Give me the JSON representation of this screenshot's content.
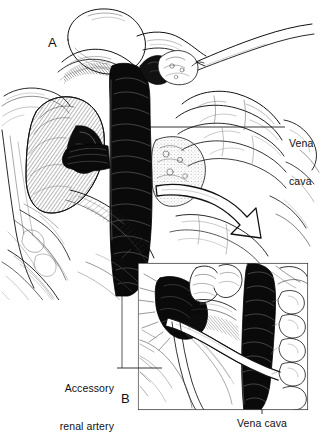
{
  "figure": {
    "type": "medical-surgical-illustration",
    "style": "pen-and-ink line drawing",
    "background_color": "#ffffff",
    "ink_color": "#111111",
    "width": 323,
    "height": 434
  },
  "panels": [
    {
      "id": "A",
      "letter": "A",
      "position": {
        "x": 48,
        "y": 36
      },
      "description": "Main operative field view: right kidney retracted, inferior vena cava exposed vertically in center, bowel loops reflected to the right, duodenum superiorly, curved retraction arrow indicating medial mobilization"
    },
    {
      "id": "B",
      "letter": "B",
      "position": {
        "x": 121,
        "y": 392
      },
      "description": "Magnified inset detail: accessory renal artery crossing anterior to the vena cava",
      "inset_box": {
        "x": 138,
        "y": 263,
        "width": 170,
        "height": 147
      }
    }
  ],
  "annotations": [
    {
      "id": "vena-cava-top",
      "text_lines": [
        "Vena",
        "cava"
      ],
      "align": "left",
      "text_position": {
        "x": 289,
        "y": 113
      },
      "leader": {
        "type": "horizontal",
        "x1": 150,
        "y1": 127,
        "x2": 285,
        "y2": 127
      }
    },
    {
      "id": "accessory-renal-artery",
      "text_lines": [
        "Accessory",
        "renal artery"
      ],
      "align": "right",
      "text_position": {
        "x": 44,
        "y": 358
      },
      "leader": {
        "type": "horizontal",
        "x1": 118,
        "y1": 368,
        "x2": 160,
        "y2": 368
      }
    },
    {
      "id": "vena-cava-bottom",
      "text_lines": [
        "Vena cava"
      ],
      "align": "center",
      "text_position": {
        "x": 228,
        "y": 418
      },
      "leader": {
        "type": "vertical",
        "x1": 262,
        "y1": 410,
        "x2": 262,
        "y2": 413
      }
    }
  ],
  "structures": {
    "vena_cava": "Inferior vena cava, rendered dark with dense cross-hatching",
    "kidney": "Right kidney, left of field, stippled and hatched",
    "bowel": "Reflected bowel loops, right of field",
    "duodenum": "Duodenum / liver edge superiorly",
    "accessory_renal_artery": "Pale vessel crossing diagonally in inset B",
    "retraction_arrow": "Large open curved arrow pointing inferolaterally to the right"
  }
}
